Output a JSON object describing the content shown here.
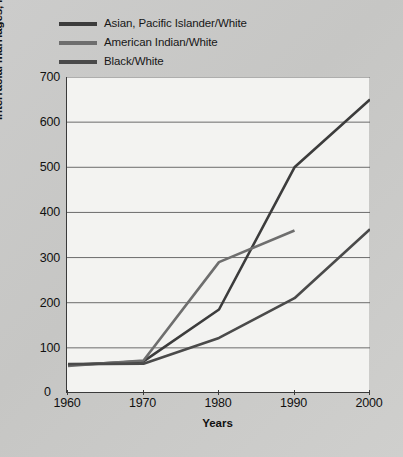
{
  "chart_data": {
    "type": "line",
    "title": "",
    "xlabel": "Years",
    "ylabel": "Interracial marriages, in thousands",
    "x": [
      1960,
      1970,
      1980,
      1990,
      2000
    ],
    "xtick_labels": [
      "1960",
      "1970",
      "1980",
      "1990",
      "2000"
    ],
    "ytick_labels": [
      "100",
      "200",
      "300",
      "400",
      "500",
      "600",
      "700"
    ],
    "ytick_values": [
      100,
      200,
      300,
      400,
      500,
      600,
      700
    ],
    "origin_label": "0",
    "xlim": [
      1960,
      2000
    ],
    "ylim": [
      0,
      700
    ],
    "grid": "horizontal",
    "legend_position": "above-plot-left",
    "series": [
      {
        "name": "Asian, Pacific Islander/White",
        "color": "#3c3c3c",
        "x": [
          1960,
          1970,
          1980,
          1990,
          2000
        ],
        "values": [
          62,
          70,
          185,
          500,
          650
        ]
      },
      {
        "name": "American Indian/White",
        "color": "#6e6e6e",
        "x": [
          1960,
          1970,
          1980,
          1990
        ],
        "values": [
          60,
          72,
          290,
          360
        ]
      },
      {
        "name": "Black/White",
        "color": "#4a4a4a",
        "x": [
          1960,
          1970,
          1980,
          1990,
          2000
        ],
        "values": [
          64,
          65,
          122,
          210,
          363
        ]
      }
    ]
  },
  "colors": {
    "page_background": "#c9c9c7",
    "plot_background": "#f3f3f1",
    "axis": "#3a3a3a",
    "gridline": "#6b6b6b",
    "text": "#111111"
  }
}
